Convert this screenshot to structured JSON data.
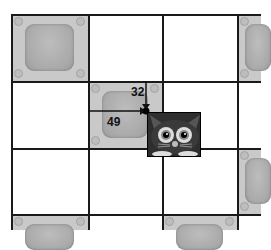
{
  "diagram": {
    "grid": {
      "columns_x": [
        11,
        88,
        162,
        237
      ],
      "rows_y": [
        14,
        81,
        148,
        214
      ],
      "line_color": "#1a1a1a"
    },
    "tiles": [
      {
        "col": 0,
        "row": 0
      },
      {
        "col": 1,
        "row": 1
      },
      {
        "col": 3,
        "row": 0
      },
      {
        "col": 3,
        "row": 2
      },
      {
        "col": 0,
        "row": 3
      },
      {
        "col": 2,
        "row": 3
      }
    ],
    "point": {
      "x": 146,
      "y": 111
    },
    "labels": {
      "offset_x": "49",
      "offset_y": "32"
    },
    "sprite": {
      "name": "cat",
      "colors": {
        "body": "#2b2b2b",
        "eyes": "#d9d9d9"
      }
    }
  }
}
